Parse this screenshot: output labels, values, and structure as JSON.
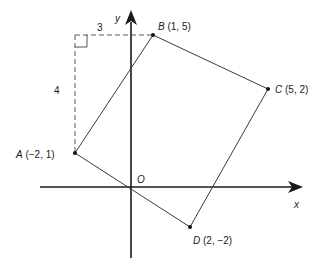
{
  "diagram": {
    "type": "coordinate-geometry",
    "axes": {
      "x_label": "x",
      "y_label": "y",
      "origin_label": "O"
    },
    "points": [
      {
        "name": "A",
        "coords": "(−2, 1)",
        "x": -2,
        "y": 1
      },
      {
        "name": "B",
        "coords": "(1, 5)",
        "x": 1,
        "y": 5
      },
      {
        "name": "C",
        "coords": "(5, 2)",
        "x": 5,
        "y": 2
      },
      {
        "name": "D",
        "coords": "(2, −2)",
        "x": 2,
        "y": -2
      }
    ],
    "construction": {
      "horizontal_length": "3",
      "vertical_length": "4"
    },
    "colors": {
      "axes": "#1a1a1a",
      "shape": "#3a3a3a",
      "dashed": "#555555"
    }
  }
}
